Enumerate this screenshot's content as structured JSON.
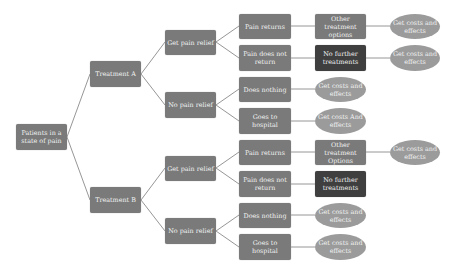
{
  "colors": {
    "box": "#7a7a7a",
    "box_dark": "#3f3f3f",
    "oval": "#9b9b9b",
    "edge": "#8a8a8a",
    "text": "#f2f2f2"
  },
  "root": {
    "label": "Patients in a state of pain"
  },
  "treatment_a": {
    "label": "Treatment A",
    "relief": {
      "label": "Get pain relief",
      "pain_returns": {
        "label": "Pain returns",
        "next": "Other treatment options",
        "outcome": "Get costs and effects"
      },
      "pain_not_return": {
        "label": "Pain does not return",
        "next": "No further treatments",
        "outcome": "Get costs and effects"
      }
    },
    "no_relief": {
      "label": "No pain relief",
      "does_nothing": {
        "label": "Does nothing",
        "outcome": "Get costs and effects"
      },
      "hospital": {
        "label": "Goes to hospital",
        "outcome": "Get costs And effects"
      }
    }
  },
  "treatment_b": {
    "label": "Treatment B",
    "relief": {
      "label": "Get pain relief",
      "pain_returns": {
        "label": "Pain returns",
        "next": "Other treatment Options",
        "outcome": "Get costs and effects"
      },
      "pain_not_return": {
        "label": "Pain does not return",
        "next": "No further treatments"
      }
    },
    "no_relief": {
      "label": "No pain relief",
      "does_nothing": {
        "label": "Does nothing",
        "outcome": "Get costs and effects"
      },
      "hospital": {
        "label": "Goes to hospital",
        "outcome": "Get costs and effects"
      }
    }
  }
}
